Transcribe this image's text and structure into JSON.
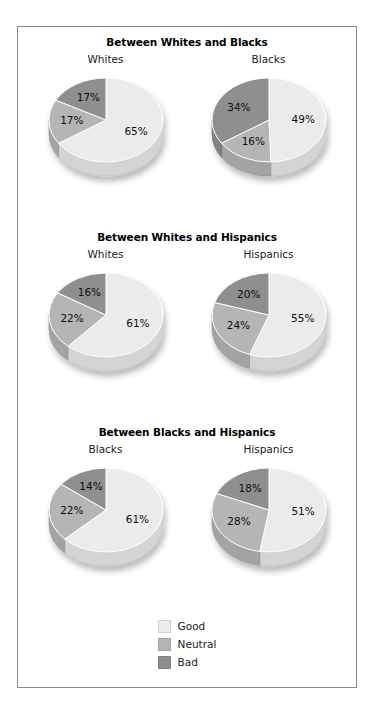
{
  "figure": {
    "border_color": "#8a8a8a",
    "background": "#ffffff"
  },
  "legend": {
    "items": [
      {
        "label": "Good",
        "color": "#ebebeb"
      },
      {
        "label": "Neutral",
        "color": "#b5b5b5"
      },
      {
        "label": "Bad",
        "color": "#8f8f8f"
      }
    ]
  },
  "panels": [
    {
      "title": "Between Whites and Blacks",
      "charts": [
        {
          "group": "Whites",
          "values": [
            65,
            17,
            17
          ],
          "labels": [
            "65%",
            "17%",
            "17%"
          ]
        },
        {
          "group": "Blacks",
          "values": [
            49,
            16,
            34
          ],
          "labels": [
            "49%",
            "16%",
            "34%"
          ]
        }
      ]
    },
    {
      "title": "Between Whites and Hispanics",
      "charts": [
        {
          "group": "Whites",
          "values": [
            61,
            22,
            16
          ],
          "labels": [
            "61%",
            "22%",
            "16%"
          ]
        },
        {
          "group": "Hispanics",
          "values": [
            55,
            24,
            20
          ],
          "labels": [
            "55%",
            "24%",
            "20%"
          ]
        }
      ]
    },
    {
      "title": "Between Blacks and Hispanics",
      "charts": [
        {
          "group": "Blacks",
          "values": [
            61,
            22,
            14
          ],
          "labels": [
            "61%",
            "22%",
            "14%"
          ]
        },
        {
          "group": "Hispanics",
          "values": [
            51,
            28,
            18
          ],
          "labels": [
            "51%",
            "28%",
            "18%"
          ]
        }
      ]
    }
  ],
  "chart_data": {
    "type": "pie",
    "title": "",
    "legend_position": "bottom-center",
    "categories": [
      "Good",
      "Neutral",
      "Bad"
    ],
    "colors": [
      "#ebebeb",
      "#b5b5b5",
      "#8f8f8f"
    ],
    "units": "percent",
    "charts": [
      {
        "panel": "Between Whites and Blacks",
        "name": "Whites",
        "slices": [
          {
            "category": "Good",
            "value": 65,
            "label": "65%"
          },
          {
            "category": "Neutral",
            "value": 17,
            "label": "17%"
          },
          {
            "category": "Bad",
            "value": 17,
            "label": "17%"
          }
        ]
      },
      {
        "panel": "Between Whites and Blacks",
        "name": "Blacks",
        "slices": [
          {
            "category": "Good",
            "value": 49,
            "label": "49%"
          },
          {
            "category": "Neutral",
            "value": 16,
            "label": "16%"
          },
          {
            "category": "Bad",
            "value": 34,
            "label": "34%"
          }
        ]
      },
      {
        "panel": "Between Whites and Hispanics",
        "name": "Whites",
        "slices": [
          {
            "category": "Good",
            "value": 61,
            "label": "61%"
          },
          {
            "category": "Neutral",
            "value": 22,
            "label": "22%"
          },
          {
            "category": "Bad",
            "value": 16,
            "label": "16%"
          }
        ]
      },
      {
        "panel": "Between Whites and Hispanics",
        "name": "Hispanics",
        "slices": [
          {
            "category": "Good",
            "value": 55,
            "label": "55%"
          },
          {
            "category": "Neutral",
            "value": 24,
            "label": "24%"
          },
          {
            "category": "Bad",
            "value": 20,
            "label": "20%"
          }
        ]
      },
      {
        "panel": "Between Blacks and Hispanics",
        "name": "Blacks",
        "slices": [
          {
            "category": "Good",
            "value": 61,
            "label": "61%"
          },
          {
            "category": "Neutral",
            "value": 22,
            "label": "22%"
          },
          {
            "category": "Bad",
            "value": 14,
            "label": "14%"
          }
        ]
      },
      {
        "panel": "Between Blacks and Hispanics",
        "name": "Hispanics",
        "slices": [
          {
            "category": "Good",
            "value": 51,
            "label": "51%"
          },
          {
            "category": "Neutral",
            "value": 28,
            "label": "28%"
          },
          {
            "category": "Bad",
            "value": 18,
            "label": "18%"
          }
        ]
      }
    ]
  }
}
